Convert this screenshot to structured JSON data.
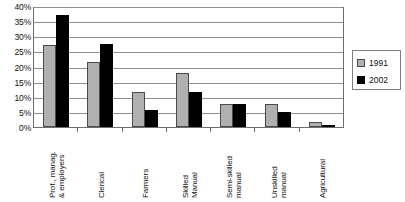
{
  "chart_data": {
    "type": "bar",
    "title": "",
    "xlabel": "",
    "ylabel": "",
    "ylim": [
      0,
      40
    ],
    "yticks": [
      "0%",
      "5%",
      "10%",
      "15%",
      "20%",
      "25%",
      "30%",
      "35%",
      "40%"
    ],
    "ytick_values": [
      0,
      5,
      10,
      15,
      20,
      25,
      30,
      35,
      40
    ],
    "grid": true,
    "legend_position": "right",
    "categories": [
      "Prof., manag.\n& employers",
      "Clerical",
      "Farmers",
      "Skilled\nManual",
      "Semi-skilled\nmanual",
      "Unskilled\nmanual",
      "Agricultural"
    ],
    "series": [
      {
        "name": "1991",
        "color": "#b0b0b0",
        "values": [
          27.0,
          21.5,
          11.5,
          18.0,
          7.5,
          7.5,
          1.5
        ]
      },
      {
        "name": "2002",
        "color": "#000000",
        "values": [
          37.0,
          27.5,
          5.5,
          11.5,
          7.5,
          5.0,
          0.5
        ]
      }
    ]
  },
  "legend": {
    "entries": [
      {
        "label": "1991",
        "swatch": "gray-swatch"
      },
      {
        "label": "2002",
        "swatch": "black-swatch"
      }
    ]
  }
}
